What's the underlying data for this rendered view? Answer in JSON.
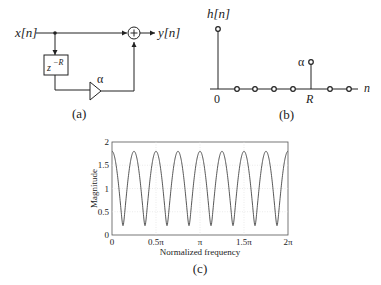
{
  "panel_a": {
    "input_label": "x[n]",
    "output_label": "y[n]",
    "delay_label": "z",
    "delay_exponent": "−R",
    "gain_label": "α",
    "caption": "(a)"
  },
  "panel_b": {
    "y_label": "h[n]",
    "x_label": "n",
    "origin_label": "0",
    "r_label": "R",
    "alpha_label": "α",
    "caption": "(b)"
  },
  "panel_c": {
    "caption": "(c)"
  },
  "chart_data": {
    "type": "line",
    "title": "",
    "xlabel": "Normalized frequency",
    "ylabel": "Magnitude",
    "xlim": [
      0,
      6.2832
    ],
    "ylim": [
      0,
      2
    ],
    "x_ticks": [
      "0",
      "0.5π",
      "π",
      "1.5π",
      "2π"
    ],
    "y_ticks": [
      "0",
      "0.5",
      "1",
      "1.5",
      "2"
    ],
    "grid": true,
    "series": [
      {
        "name": "|H(e^jω)| = |1 + 0.8 e^{-j8ω}|",
        "function": "sqrt(1 + a*a + 2*a*cos(R*w))",
        "params": {
          "a": 0.8,
          "R": 8
        },
        "max": 1.8,
        "min": 0.2,
        "num_peaks": 9,
        "num_notches": 8
      }
    ]
  }
}
